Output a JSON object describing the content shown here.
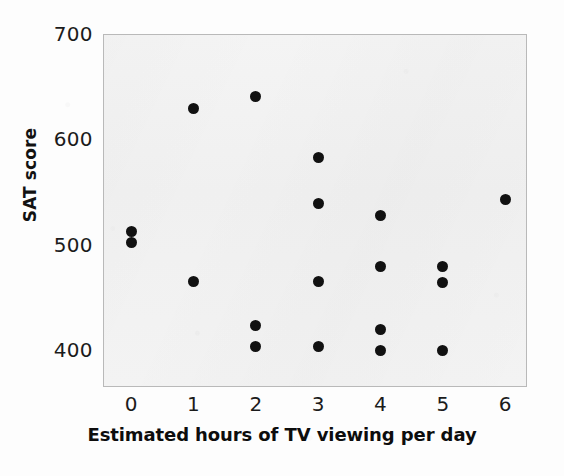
{
  "chart_data": {
    "type": "scatter",
    "title": "",
    "xlabel": "Estimated hours of TV viewing per day",
    "ylabel": "SAT score",
    "xlim": [
      -0.45,
      6.35
    ],
    "ylim": [
      365,
      700
    ],
    "xticks": [
      0,
      1,
      2,
      3,
      4,
      5,
      6
    ],
    "xtick_labels": [
      "0",
      "1",
      "2",
      "3",
      "4",
      "5",
      "6"
    ],
    "yticks": [
      400,
      500,
      600,
      700
    ],
    "ytick_labels": [
      "400",
      "500",
      "600",
      "700"
    ],
    "grid": false,
    "legend": null,
    "marker": "filled-circle",
    "marker_color": "#111111",
    "plot_background": "#f2f2f2",
    "points": [
      {
        "x": 0,
        "y": 513
      },
      {
        "x": 0,
        "y": 502
      },
      {
        "x": 1,
        "y": 629
      },
      {
        "x": 1,
        "y": 465
      },
      {
        "x": 2,
        "y": 641
      },
      {
        "x": 2,
        "y": 423
      },
      {
        "x": 2,
        "y": 403
      },
      {
        "x": 3,
        "y": 583
      },
      {
        "x": 3,
        "y": 539
      },
      {
        "x": 3,
        "y": 465
      },
      {
        "x": 3,
        "y": 403
      },
      {
        "x": 4,
        "y": 528
      },
      {
        "x": 4,
        "y": 479
      },
      {
        "x": 4,
        "y": 420
      },
      {
        "x": 4,
        "y": 400
      },
      {
        "x": 5,
        "y": 479
      },
      {
        "x": 5,
        "y": 464
      },
      {
        "x": 5,
        "y": 400
      },
      {
        "x": 6,
        "y": 543
      }
    ]
  }
}
